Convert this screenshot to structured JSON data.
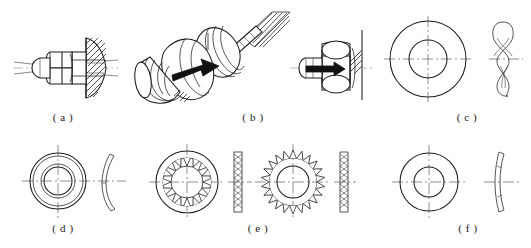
{
  "figure": {
    "panel_count": 6,
    "line_color": "#1d1d1d",
    "background_color": "#ffffff",
    "center_line_color": "#555555"
  },
  "panels": [
    {
      "key": "a",
      "caption": "( a )",
      "caption_x": 63,
      "caption_y": 118,
      "subject": "bolted joint section view with nut, washer and conical plate",
      "view": "sectional elevation"
    },
    {
      "key": "b",
      "caption": "( b )",
      "caption_x": 253,
      "caption_y": 118,
      "subject": "pictorial isometric view of bolt and nut with tightening arrow",
      "view": "isometric pictorial"
    },
    {
      "key": "c",
      "caption": "( c )",
      "caption_x": 467,
      "caption_y": 118,
      "subject": "wave spring washer",
      "view": "plan view and edge view"
    },
    {
      "key": "d",
      "caption": "( d )",
      "caption_x": 63,
      "caption_y": 229,
      "subject": "split helical spring lock washer",
      "view": "plan view and edge view"
    },
    {
      "key": "e",
      "caption": "( e )",
      "caption_x": 258,
      "caption_y": 229,
      "subject": "internal tooth and external tooth lock washers",
      "view": "plan views and edge views"
    },
    {
      "key": "f",
      "caption": "( f )",
      "caption_x": 468,
      "caption_y": 229,
      "subject": "conical disc (Belleville) spring washer",
      "view": "plan view and edge view"
    }
  ],
  "annotations": {
    "arrow_b": "tightening direction arrow",
    "arrow_c": "tightening direction arrow",
    "internal_tooth_count": 16,
    "external_tooth_count": 22
  }
}
